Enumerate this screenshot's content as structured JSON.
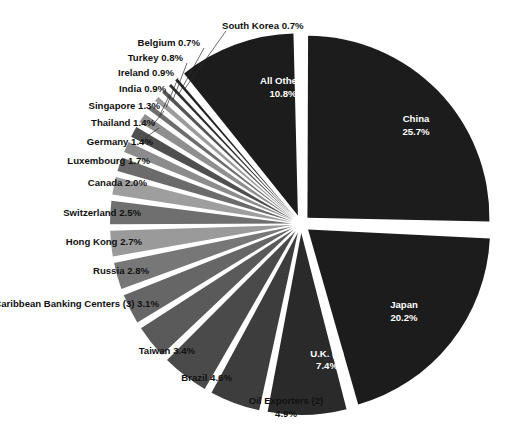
{
  "chart_data": {
    "type": "pie",
    "title": "",
    "subtitle": "",
    "xlabel": "",
    "ylabel": "",
    "legend_position": "none",
    "grid": false,
    "units": "percent",
    "total": 100.0,
    "categories": [
      "China",
      "Japan",
      "All Others",
      "South Korea",
      "Belgium",
      "Turkey",
      "Ireland",
      "India",
      "Singapore",
      "Thailand",
      "Germany",
      "Luxembourg",
      "Canada",
      "Switzerland",
      "Hong Kong",
      "Russia",
      "Caribbean Banking Centers (3)",
      "Taiwan",
      "Brazil",
      "Oil Exporters (2)",
      "U.K. (1)"
    ],
    "values": [
      25.7,
      20.2,
      10.8,
      0.7,
      0.7,
      0.8,
      0.9,
      0.9,
      1.3,
      1.4,
      1.4,
      1.7,
      2.0,
      2.5,
      2.7,
      2.8,
      3.1,
      3.4,
      4.6,
      4.9,
      7.4
    ],
    "slices": [
      {
        "label": "China",
        "value": 25.7,
        "text": "China",
        "pct_text": "25.7%",
        "color": "#1c1c1c",
        "label_placement": "inside"
      },
      {
        "label": "Japan",
        "value": 20.2,
        "text": "Japan",
        "pct_text": "20.2%",
        "color": "#1c1c1c",
        "label_placement": "inside"
      },
      {
        "label": "U.K. (1)",
        "value": 7.4,
        "text": "U.K. (1)",
        "pct_text": "7.4%",
        "color": "#2a2a2a",
        "label_placement": "inside"
      },
      {
        "label": "Oil Exporters (2)",
        "value": 4.9,
        "text": "Oil Exporters (2)",
        "pct_text": "4.9%",
        "color": "#3d3d3d",
        "label_placement": "outside"
      },
      {
        "label": "Brazil",
        "value": 4.6,
        "text": "Brazil 4.6%",
        "pct_text": "4.6%",
        "color": "#4a4a4a",
        "label_placement": "outside"
      },
      {
        "label": "Taiwan",
        "value": 3.4,
        "text": "Taiwan 3.4%",
        "pct_text": "3.4%",
        "color": "#5a5a5a",
        "label_placement": "outside"
      },
      {
        "label": "Caribbean Banking Centers (3)",
        "value": 3.1,
        "text": "Caribbean Banking Centers (3) 3.1%",
        "pct_text": "3.1%",
        "color": "#666666",
        "label_placement": "outside"
      },
      {
        "label": "Russia",
        "value": 2.8,
        "text": "Russia 2.8%",
        "pct_text": "2.8%",
        "color": "#777777",
        "label_placement": "outside"
      },
      {
        "label": "Hong Kong",
        "value": 2.7,
        "text": "Hong Kong 2.7%",
        "pct_text": "2.7%",
        "color": "#9a9a9a",
        "label_placement": "outside"
      },
      {
        "label": "Switzerland",
        "value": 2.5,
        "text": "Switzerland 2.5%",
        "pct_text": "2.5%",
        "color": "#6f6f6f",
        "label_placement": "outside"
      },
      {
        "label": "Canada",
        "value": 2.0,
        "text": "Canada 2.0%",
        "pct_text": "2.0%",
        "color": "#9e9e9e",
        "label_placement": "outside"
      },
      {
        "label": "Luxembourg",
        "value": 1.7,
        "text": "Luxembourg 1.7%",
        "pct_text": "1.7%",
        "color": "#6b6b6b",
        "label_placement": "outside"
      },
      {
        "label": "Germany",
        "value": 1.4,
        "text": "Germany 1.4%",
        "pct_text": "1.4%",
        "color": "#8c8c8c",
        "label_placement": "outside"
      },
      {
        "label": "Thailand",
        "value": 1.4,
        "text": "Thailand 1.4%",
        "pct_text": "1.4%",
        "color": "#4f4f4f",
        "label_placement": "outside"
      },
      {
        "label": "Singapore",
        "value": 1.3,
        "text": "Singapore 1.3%",
        "pct_text": "1.3%",
        "color": "#8f8f8f",
        "label_placement": "outside"
      },
      {
        "label": "India",
        "value": 0.9,
        "text": "India 0.9%",
        "pct_text": "0.9%",
        "color": "#6d6d6d",
        "label_placement": "outside"
      },
      {
        "label": "Ireland",
        "value": 0.9,
        "text": "Ireland 0.9%",
        "pct_text": "0.9%",
        "color": "#9c9c9c",
        "label_placement": "outside"
      },
      {
        "label": "Turkey",
        "value": 0.8,
        "text": "Turkey 0.8%",
        "pct_text": "0.8%",
        "color": "#555555",
        "label_placement": "outside"
      },
      {
        "label": "Belgium",
        "value": 0.7,
        "text": "Belgium 0.7%",
        "pct_text": "0.7%",
        "color": "#2e2e2e",
        "label_placement": "outside"
      },
      {
        "label": "South Korea",
        "value": 0.7,
        "text": "South Korea 0.7%",
        "pct_text": "0.7%",
        "color": "#232323",
        "label_placement": "outside"
      },
      {
        "label": "All Others",
        "value": 10.8,
        "text": "All Others",
        "pct_text": "10.8%",
        "color": "#1c1c1c",
        "label_placement": "inside"
      }
    ]
  },
  "labels": {
    "china": {
      "name": "China",
      "pct": "25.7%"
    },
    "japan": {
      "name": "Japan",
      "pct": "20.2%"
    },
    "uk": {
      "name": "U.K. (1)",
      "pct": "7.4%"
    },
    "all_others": {
      "name": "All Others",
      "pct": "10.8%"
    },
    "oil_exporters_l1": "Oil Exporters (2)",
    "oil_exporters_l2": "4.9%",
    "brazil": "Brazil 4.6%",
    "taiwan": "Taiwan 3.4%",
    "caribbean": "Caribbean Banking Centers (3) 3.1%",
    "russia": "Russia 2.8%",
    "hong_kong": "Hong Kong 2.7%",
    "switzerland": "Switzerland 2.5%",
    "canada": "Canada 2.0%",
    "luxembourg": "Luxembourg 1.7%",
    "germany": "Germany 1.4%",
    "thailand": "Thailand 1.4%",
    "singapore": "Singapore 1.3%",
    "india": "India 0.9%",
    "ireland": "Ireland 0.9%",
    "turkey": "Turkey 0.8%",
    "belgium": "Belgium 0.7%",
    "south_korea": "South Korea 0.7%"
  },
  "style": {
    "background": "#ffffff",
    "dark": "#1c1c1c",
    "mid_gray": "#5a5a5a",
    "light_gray": "#9a9a9a",
    "text": "#111111",
    "inside_text": "#ffffff"
  }
}
